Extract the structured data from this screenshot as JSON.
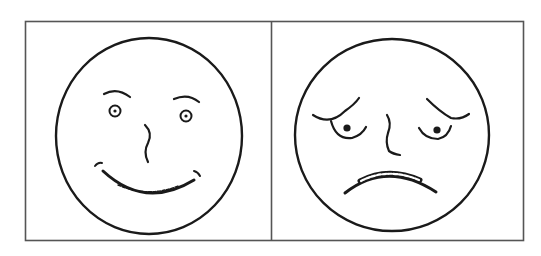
{
  "figure": {
    "stroke_color": "#1a1a1a",
    "frame_color": "#555555",
    "background": "#ffffff",
    "panels": [
      {
        "id": "left",
        "expression": "happy",
        "features": [
          "arched eyebrows",
          "round eyes with pupils",
          "wavy nose",
          "broad smile with teeth",
          "dimples"
        ]
      },
      {
        "id": "right",
        "expression": "sad",
        "features": [
          "slanted worried eyebrows",
          "droopy eyes with pupils",
          "curved nose",
          "frown with clenched teeth"
        ]
      }
    ]
  }
}
